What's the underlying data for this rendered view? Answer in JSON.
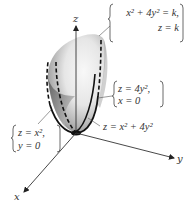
{
  "diagram": {
    "type": "3d-surface-plot",
    "surface": "elliptic paraboloid",
    "axes": {
      "x_label": "x",
      "y_label": "y",
      "z_label": "z"
    },
    "annotations": {
      "level_curve": {
        "line1": "x² + 4y² = k,",
        "line2": "z = k"
      },
      "trace_yz": {
        "line1": "z = 4y²,",
        "line2": "x = 0"
      },
      "surface_eq": "z = x² + 4y²",
      "trace_xz": {
        "line1": "z = x²,",
        "line2": "y = 0"
      }
    },
    "colors": {
      "surface_light": "#f4f4f4",
      "surface_dark": "#6a6a6a",
      "curve": "#111111",
      "axis": "#333333",
      "text": "#333333"
    }
  }
}
